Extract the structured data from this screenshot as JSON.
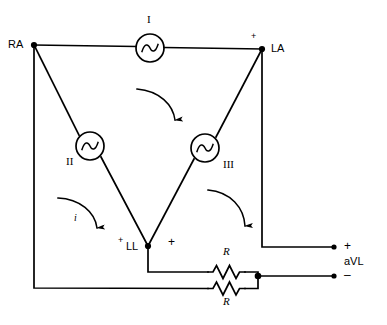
{
  "figure": {
    "type": "electrical-circuit-schematic",
    "background_color": "#ffffff",
    "line_color": "#000000"
  },
  "nodes": {
    "right_arm": {
      "label": "RA",
      "x": 34,
      "y": 45
    },
    "left_arm": {
      "label": "LA",
      "x": 262,
      "y": 49
    },
    "left_leg": {
      "label": "LL",
      "x": 148,
      "y": 246
    }
  },
  "sources": [
    {
      "id": "source-1",
      "label": "I",
      "cx": 150,
      "cy": 48,
      "r": 14
    },
    {
      "id": "source-2",
      "label": "II",
      "cx": 90,
      "cy": 146,
      "r": 14
    },
    {
      "id": "source-3",
      "label": "III",
      "cx": 205,
      "cy": 148,
      "r": 14
    }
  ],
  "resistors": [
    {
      "id": "resistor-top",
      "label": "R",
      "x": 208,
      "y": 272,
      "label_x": 227,
      "label_y": 253
    },
    {
      "id": "resistor-bottom",
      "label": "R",
      "x": 208,
      "y": 289,
      "label_x": 227,
      "label_y": 301
    }
  ],
  "polarity_marks": {
    "la_plus": "+",
    "ll_plus_left": "+",
    "ll_plus_right": "+",
    "output_plus": "+",
    "output_minus": "–"
  },
  "current_arrow": {
    "label": "i",
    "description": "mesh current direction arrow"
  },
  "output": {
    "label": "aVL",
    "plus_terminal": {
      "x": 334,
      "y": 247
    },
    "minus_terminal": {
      "x": 334,
      "y": 276
    }
  },
  "arrows": [
    {
      "id": "arrow-left-current",
      "note": "clockwise arc inside left mesh, labeled i"
    },
    {
      "id": "arrow-center",
      "note": "clockwise arc inside triangle below source I"
    },
    {
      "id": "arrow-right",
      "note": "clockwise arc inside right mesh"
    }
  ]
}
